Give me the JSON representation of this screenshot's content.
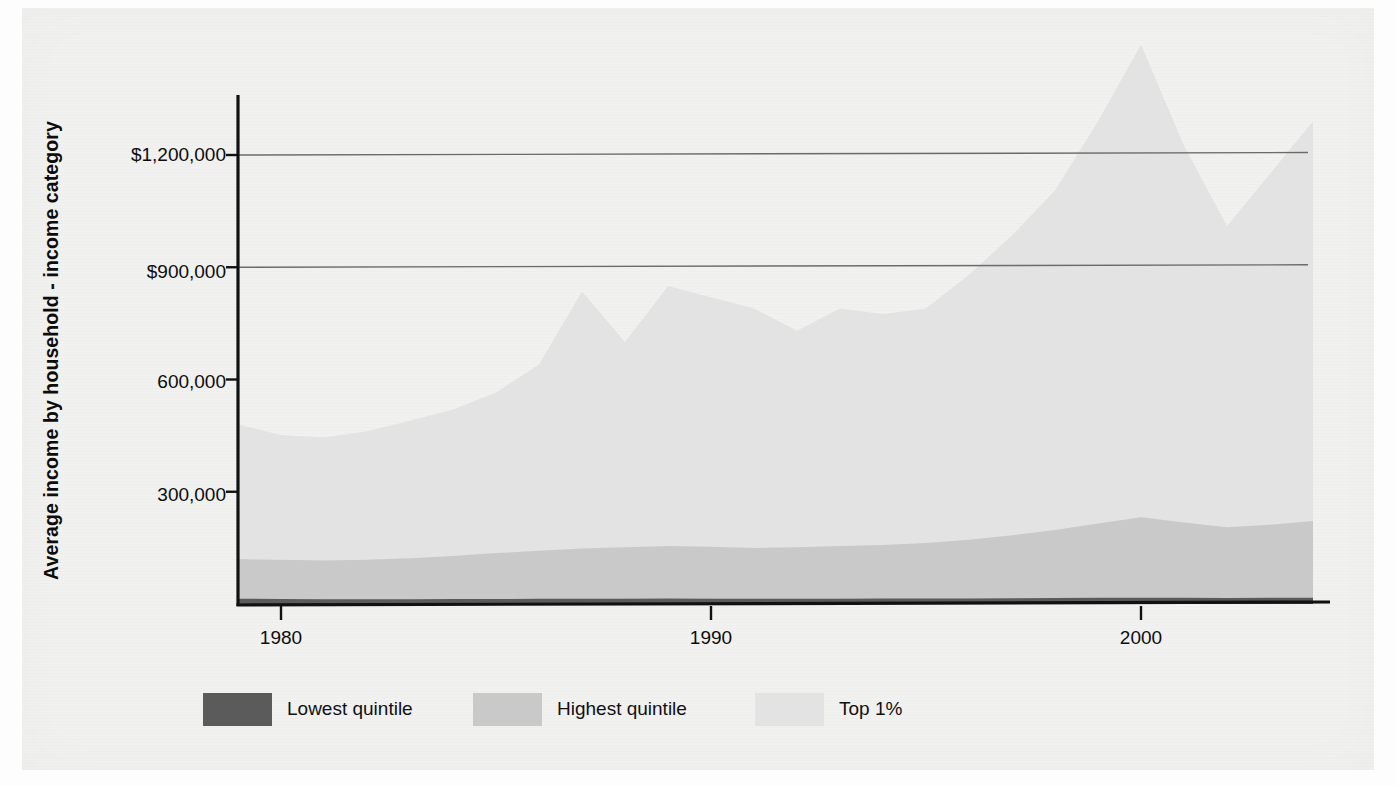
{
  "chart_data": {
    "type": "area",
    "title": "",
    "subtitle": "",
    "xlabel": "",
    "ylabel": "Average income by household - income category",
    "stacked": false,
    "grid": true,
    "grid_axis": "y",
    "gridlines_at": [
      900000,
      1200000
    ],
    "legend_position": "bottom",
    "xlim": [
      1979,
      2004
    ],
    "ylim": [
      0,
      1600000
    ],
    "x_ticks": [
      1980,
      1990,
      2000
    ],
    "x_tick_labels": [
      "1980",
      "1990",
      "2000"
    ],
    "y_ticks": [
      300000,
      600000,
      900000,
      1200000
    ],
    "y_tick_labels": [
      "300,000",
      "600,000",
      "$900,000",
      "$1,200,000"
    ],
    "x": [
      1979,
      1980,
      1981,
      1982,
      1983,
      1984,
      1985,
      1986,
      1987,
      1988,
      1989,
      1990,
      1991,
      1992,
      1993,
      1994,
      1995,
      1996,
      1997,
      1998,
      1999,
      2000,
      2001,
      2002,
      2003,
      2004
    ],
    "series": [
      {
        "name": "Top 1%",
        "color": "#e3e3e3",
        "values": [
          480000,
          452000,
          445000,
          462000,
          490000,
          520000,
          565000,
          640000,
          835000,
          700000,
          850000,
          820000,
          790000,
          730000,
          790000,
          775000,
          790000,
          880000,
          985000,
          1105000,
          1290000,
          1495000,
          1225000,
          1010000,
          1150000,
          1290000
        ]
      },
      {
        "name": "Highest quintile",
        "color": "#c9c9c9",
        "values": [
          120000,
          118000,
          116000,
          118000,
          122000,
          128000,
          136000,
          142000,
          148000,
          152000,
          155000,
          153000,
          150000,
          152000,
          155000,
          158000,
          163000,
          172000,
          184000,
          198000,
          215000,
          232000,
          218000,
          205000,
          212000,
          222000
        ]
      },
      {
        "name": "Lowest quintile",
        "color": "#5b5b5b",
        "values": [
          14000,
          13500,
          13000,
          12800,
          12900,
          13200,
          13500,
          13800,
          14000,
          14200,
          14500,
          14300,
          14000,
          14100,
          14200,
          14400,
          14700,
          15000,
          15400,
          15900,
          16400,
          16800,
          16500,
          16200,
          16400,
          16700
        ]
      }
    ]
  },
  "axis": {
    "y_title": "Average income by household - income category",
    "y_tick_labels": [
      "$1,200,000",
      "$900,000",
      "600,000",
      "300,000"
    ],
    "x_tick_labels": [
      "1980",
      "1990",
      "2000"
    ]
  },
  "legend": {
    "items": [
      {
        "label": "Lowest quintile",
        "color": "#5b5b5b"
      },
      {
        "label": "Highest quintile",
        "color": "#c9c9c9"
      },
      {
        "label": "Top 1%",
        "color": "#e3e3e3"
      }
    ]
  },
  "colors": {
    "paper": "#f1f1f0",
    "axis": "#111111",
    "gridline": "#6b6b6b",
    "text": "#0d0d0d"
  }
}
